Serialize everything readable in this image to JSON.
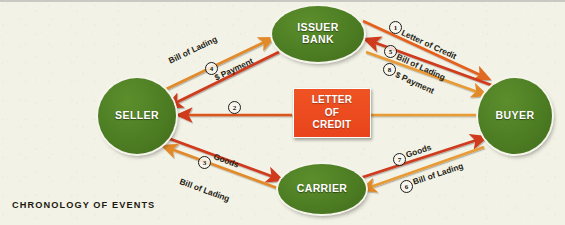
{
  "diagram": {
    "footer_label": "CHRONOLOGY OF EVENTS",
    "center_box": {
      "line1": "LETTER",
      "line2": "OF",
      "line3": "CREDIT"
    },
    "nodes": [
      {
        "id": "issuer-bank",
        "line1": "ISSUER",
        "line2": "BANK"
      },
      {
        "id": "buyer",
        "line1": "BUYER",
        "line2": ""
      },
      {
        "id": "seller",
        "line1": "SELLER",
        "line2": ""
      },
      {
        "id": "carrier",
        "line1": "CARRIER",
        "line2": ""
      }
    ],
    "flows": [
      {
        "step": "1",
        "label": "Letter of Credit",
        "from": "buyer",
        "to": "issuer-bank",
        "color": "#e4601f"
      },
      {
        "step": "2",
        "label": "",
        "from": "issuer-bank",
        "to": "seller",
        "color": "#e06a22"
      },
      {
        "step": "3",
        "label": "Goods",
        "from": "seller",
        "to": "carrier",
        "color": "#cf3a1c"
      },
      {
        "step": "4",
        "label": "$ Payment",
        "from": "issuer-bank",
        "to": "seller",
        "color": "#cf3a1c"
      },
      {
        "step": "5",
        "label": "Bill of Lading",
        "from": "buyer",
        "to": "issuer-bank",
        "color": "#cf3a1c"
      },
      {
        "step": "6",
        "label": "Bill of Lading",
        "from": "buyer",
        "to": "carrier",
        "color": "#e89a36"
      },
      {
        "step": "7",
        "label": "Goods",
        "from": "carrier",
        "to": "buyer",
        "color": "#cf3a1c"
      },
      {
        "step": "8",
        "label": "$ Payment",
        "from": "buyer",
        "to": "issuer-bank",
        "color": "#e89a36"
      }
    ],
    "unnumbered_labels": [
      {
        "id": "bill-of-lading-seller-to-bank",
        "label": "Bill of Lading",
        "from": "seller",
        "to": "issuer-bank",
        "color": "#e28a2a"
      },
      {
        "id": "bill-of-lading-carrier-to-seller",
        "label": "Bill of Lading",
        "from": "carrier",
        "to": "seller",
        "color": "#e28a2a"
      }
    ],
    "colors": {
      "background": "#f3f2e6",
      "node_green": "#4d7d23",
      "box_red": "#ee4c1f",
      "arrow_red": "#cf3a1c",
      "arrow_orange": "#e28a2a",
      "top_rule": "#c9c9c4"
    }
  }
}
